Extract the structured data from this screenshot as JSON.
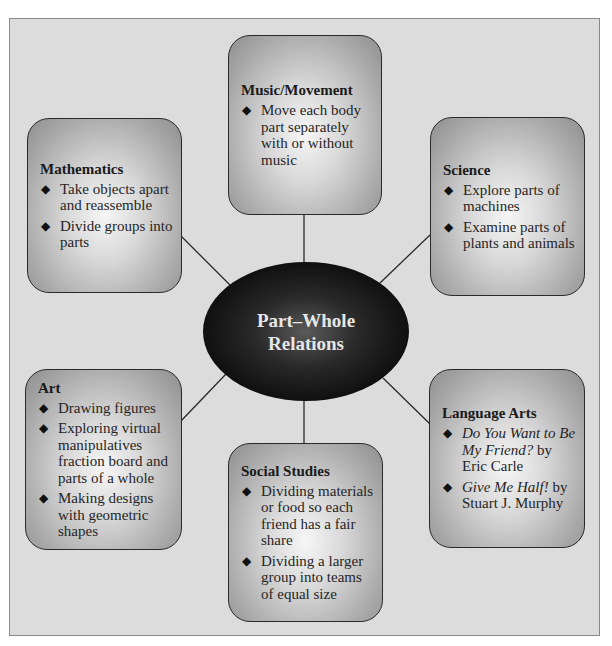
{
  "diagram": {
    "type": "concept-web",
    "center": {
      "line1": "Part–Whole",
      "line2": "Relations"
    },
    "nodes": {
      "music": {
        "title": "Music/Movement",
        "items": [
          "Move each body part separately with or without music"
        ]
      },
      "mathematics": {
        "title": "Mathematics",
        "items": [
          "Take objects apart and reassemble",
          "Divide groups into parts"
        ]
      },
      "science": {
        "title": "Science",
        "items": [
          "Explore parts of machines",
          "Examine parts of plants and animals"
        ]
      },
      "art": {
        "title": "Art",
        "items": [
          "Drawing figures",
          "Exploring virtual manipulatives fraction board and parts of a whole",
          "Making designs with geometric shapes"
        ]
      },
      "social_studies": {
        "title": "Social Studies",
        "items": [
          "Dividing materials or food so each friend has a fair share",
          "Dividing a larger group into teams of equal size"
        ]
      },
      "language_arts": {
        "title": "Language Arts",
        "items": [
          {
            "italic": "Do You Want to Be My Friend?",
            "rest": " by Eric Carle"
          },
          {
            "italic": "Give Me Half!",
            "rest": " by Stuart J. Murphy"
          }
        ]
      }
    },
    "bullet_glyph": "◆",
    "colors": {
      "background": "#dcdcdc",
      "frame_border": "#8a8a8a",
      "node_border": "#2a2a2a",
      "center_fill": "#0a0a0a",
      "center_text": "#e6e6e6",
      "connector": "#2a2a2a"
    }
  }
}
